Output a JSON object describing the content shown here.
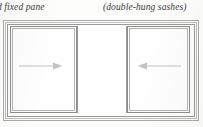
{
  "figure": {
    "type": "sliding-window-diagram",
    "background_color": "#fdfdfc",
    "line_color": "#9a9a9a"
  },
  "captions": {
    "left": {
      "text": "d fixed pane",
      "note": "truncated at left page edge",
      "style": "italic"
    },
    "right": {
      "text": "(double-hung sashes)",
      "style": "italic"
    }
  },
  "window": {
    "frame_rings": 3,
    "panes": [
      {
        "id": "left",
        "label": "left sash",
        "kind": "operable-sash",
        "arrow": {
          "name": "arrow-right-icon",
          "direction": "right",
          "meaning": "slides right"
        }
      },
      {
        "id": "center",
        "label": "fixed pane",
        "kind": "fixed-opening",
        "arrow": null
      },
      {
        "id": "right",
        "label": "right sash",
        "kind": "operable-sash",
        "arrow": {
          "name": "arrow-left-icon",
          "direction": "left",
          "meaning": "slides left"
        }
      }
    ]
  },
  "colors": {
    "line_outer": "#a9a9a9",
    "line_mid": "#bdbdbd",
    "line_inner": "#9a9a9a",
    "sash_border": "#8e8e8e",
    "arrow": "#c2c2c2",
    "text": "#3a3a3a"
  }
}
